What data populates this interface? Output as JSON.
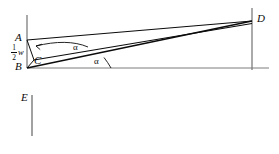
{
  "figure": {
    "background_color": "#ffffff",
    "stroke_color": "#0b0b0b",
    "axis_color": "#7d7d7d",
    "labels": {
      "A": "A",
      "B": "B",
      "C": "C",
      "D": "D",
      "E": "E",
      "alpha_upper": "α",
      "alpha_lower": "α",
      "half_w_numerator": "1",
      "half_w_denominator": "2",
      "half_w_symbol": "w"
    },
    "points": {
      "A": {
        "x": 26,
        "y": 40
      },
      "B": {
        "x": 27,
        "y": 68
      },
      "C": {
        "x": 34,
        "y": 60
      },
      "D": {
        "x": 252,
        "y": 21
      },
      "E": {
        "x": 32,
        "y": 95
      }
    },
    "segments": [
      {
        "name": "left-vertical-axis",
        "from": "top",
        "x1": 27,
        "y1": 15,
        "x2": 27,
        "y2": 68,
        "color": "#7d7d7d"
      },
      {
        "name": "right-vertical-axis",
        "x1": 252,
        "y1": 8,
        "x2": 252,
        "y2": 70,
        "color": "#7d7d7d"
      },
      {
        "name": "horizontal-baseline",
        "x1": 27,
        "y1": 68,
        "x2": 269,
        "y2": 68,
        "color": "#7d7d7d"
      },
      {
        "name": "segment-E-vertical",
        "x1": 32,
        "y1": 95,
        "x2": 32,
        "y2": 136,
        "color": "#7d7d7d"
      },
      {
        "name": "segment-A-to-D",
        "x1": 27,
        "y1": 40,
        "x2": 252,
        "y2": 21,
        "color": "#0b0b0b"
      },
      {
        "name": "segment-B-to-D",
        "x1": 27,
        "y1": 68,
        "x2": 252,
        "y2": 21,
        "color": "#0b0b0b"
      },
      {
        "name": "segment-C-to-D",
        "x1": 34,
        "y1": 60,
        "x2": 252,
        "y2": 23,
        "color": "#0b0b0b"
      },
      {
        "name": "segment-A-to-C",
        "x1": 27,
        "y1": 40,
        "x2": 34,
        "y2": 60,
        "color": "#0b0b0b"
      },
      {
        "name": "segment-B-to-C",
        "x1": 27,
        "y1": 68,
        "x2": 34,
        "y2": 60,
        "color": "#0b0b0b"
      }
    ],
    "angle_arcs": [
      {
        "name": "alpha-arc-upper",
        "vertex": "C",
        "label": "α"
      },
      {
        "name": "alpha-arc-lower",
        "vertex": "B",
        "label": "α"
      }
    ],
    "label_positions": {
      "A": {
        "left": 15,
        "top": 33
      },
      "B": {
        "left": 15,
        "top": 62
      },
      "C": {
        "left": 34,
        "top": 57
      },
      "D": {
        "left": 256,
        "top": 14
      },
      "E": {
        "left": 21,
        "top": 93
      },
      "alpha_upper": {
        "left": 73,
        "top": 45
      },
      "alpha_lower": {
        "left": 95,
        "top": 58
      }
    }
  }
}
